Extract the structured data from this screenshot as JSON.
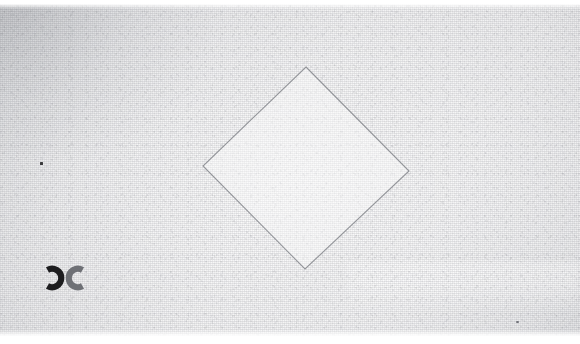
{
  "image": {
    "kind": "scanned-paper-photograph",
    "width": 580,
    "height": 344,
    "caption": "",
    "background_color": "#efeff0",
    "paper_tone_light": "#f7f7f8",
    "paper_tone_dark": "#d9dade",
    "margin_color": "#ffffff",
    "margin_top_height": 4,
    "margin_bottom_height": 8
  },
  "figure": {
    "name": "diamond-outline",
    "shape": "rotated-square",
    "stroke_color": "#8f9196",
    "stroke_width": 1,
    "fill": "none",
    "vertices": {
      "top": {
        "x": 306,
        "y": 67
      },
      "right": {
        "x": 409,
        "y": 171
      },
      "bottom": {
        "x": 305,
        "y": 269
      },
      "left": {
        "x": 203,
        "y": 166
      }
    },
    "interior_tone": "#f4f4f5"
  },
  "marks": [
    {
      "name": "cc-stamp",
      "glyphs": "ɔc",
      "description": "two back-to-back C shapes, left reversed and darker",
      "left_glyph_color": "#1d1d1f",
      "right_glyph_color": "#6e7075",
      "x": 38,
      "y": 263,
      "width": 54,
      "height": 30
    },
    {
      "name": "left-dot",
      "description": "small dark square dot",
      "color": "#3a3a3c",
      "x": 40,
      "y": 162,
      "width": 3,
      "height": 3
    },
    {
      "name": "right-dot",
      "description": "faint grey speck near lower right",
      "color": "#74767c",
      "x": 516,
      "y": 321,
      "width": 3,
      "height": 2
    }
  ],
  "regions": [
    {
      "name": "bright-band",
      "description": "lighter horizontal band across lower right",
      "x": 348,
      "y": 262,
      "width": 232,
      "height": 48,
      "color": "#fcfcfd"
    },
    {
      "name": "upper-left-shadow",
      "description": "slightly darker wash in upper left corner",
      "x": 0,
      "y": 4,
      "width": 210,
      "height": 150,
      "color": "#dcdde1"
    }
  ]
}
